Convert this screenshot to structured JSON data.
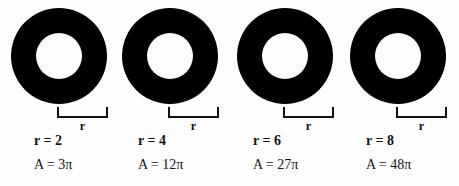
{
  "figure": {
    "type": "annulus-series-diagram",
    "background_color": "#fdfdfd",
    "ring_color": "#000000",
    "text_color": "#141414",
    "bracket_label": "r",
    "items": [
      {
        "id": "annulus-1",
        "radius_label": "r = 2",
        "area_label": "A = 3π",
        "radius_value": 2,
        "area_value": "3π",
        "bracket_label": "r"
      },
      {
        "id": "annulus-2",
        "radius_label": "r = 4",
        "area_label": "A = 12π",
        "radius_value": 4,
        "area_value": "12π",
        "bracket_label": "r"
      },
      {
        "id": "annulus-3",
        "radius_label": "r = 6",
        "area_label": "A = 27π",
        "radius_value": 6,
        "area_value": "27π",
        "bracket_label": "r"
      },
      {
        "id": "annulus-4",
        "radius_label": "r = 8",
        "area_label": "A = 48π",
        "radius_value": 8,
        "area_value": "48π",
        "bracket_label": "r"
      }
    ]
  }
}
